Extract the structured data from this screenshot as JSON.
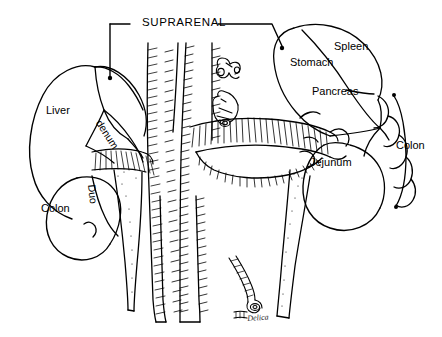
{
  "figure": {
    "title_label": "SUPRARENAL",
    "background_color": "#ffffff",
    "ink_color": "#000000",
    "signature": "Delica"
  },
  "labels": {
    "suprarenal": "SUPRARENAL",
    "liver": "Liver",
    "denum": "denum",
    "duo": "Duo",
    "colon_left": "Colon",
    "stomach": "Stomach",
    "spleen": "Spleen",
    "pancreas": "Pancreas",
    "jejunum": "Jejunum",
    "colon_right": "Colon"
  },
  "icons": {
    "leader_left": "leader-line-icon",
    "leader_right": "leader-line-icon",
    "vessel_stump_upper": "vessel-stump-icon",
    "vessel_stump_lower": "vessel-stump-icon",
    "ureter": "ureter-icon"
  }
}
